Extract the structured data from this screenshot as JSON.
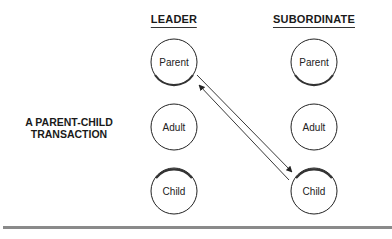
{
  "columns": {
    "leader": {
      "header": "LEADER"
    },
    "subordinate": {
      "header": "SUBORDINATE"
    }
  },
  "side_label": {
    "line1": "A PARENT-CHILD",
    "line2": "TRANSACTION"
  },
  "ego_states": {
    "leader": [
      "Parent",
      "Adult",
      "Child"
    ],
    "subordinate": [
      "Parent",
      "Adult",
      "Child"
    ]
  },
  "transactions": [
    {
      "from": "leader.Parent",
      "to": "subordinate.Child"
    },
    {
      "from": "subordinate.Child",
      "to": "leader.Parent"
    }
  ],
  "colors": {
    "stroke": "#222222",
    "rule": "#8a8a8a"
  }
}
